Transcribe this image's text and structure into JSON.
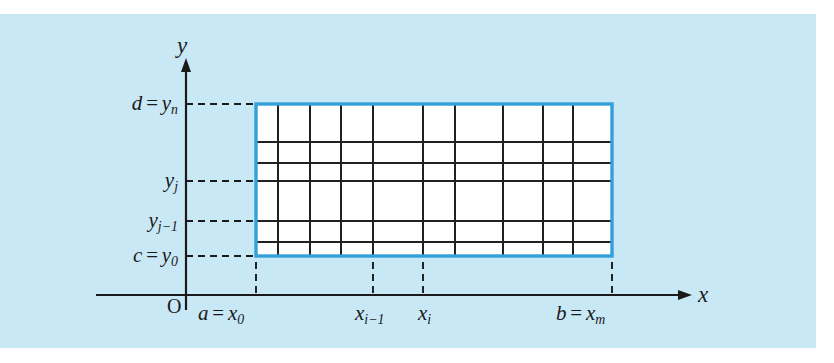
{
  "figure": {
    "kind": "partitioned-rectangle-double-integral-diagram",
    "background_color": "#c9e8f5",
    "page_color": "#ffffff",
    "region_fill_color": "#ffffff",
    "region_border_color": "#33a0dd",
    "grid_color": "#231f20",
    "axis_color": "#1a1a1a"
  },
  "axes": {
    "y_axis_label": "y",
    "x_axis_label": "x",
    "origin_label": "O"
  },
  "y_labels": [
    {
      "id": "y-top",
      "text_prefix": "d",
      "equals": "=",
      "base": "y",
      "subscript": "n",
      "value_y": 104
    },
    {
      "id": "y-j",
      "text_prefix": "",
      "equals": "",
      "base": "y",
      "subscript": "j",
      "value_y": 181
    },
    {
      "id": "y-j-minus-1",
      "text_prefix": "",
      "equals": "",
      "base": "y",
      "subscript": "j−1",
      "value_y": 221
    },
    {
      "id": "y-bottom",
      "text_prefix": "c",
      "equals": "=",
      "base": "y",
      "subscript": "0",
      "value_y": 256
    }
  ],
  "x_labels": [
    {
      "id": "x-left",
      "text_prefix": "a",
      "equals": "=",
      "base": "x",
      "subscript": "0",
      "value_x": 256
    },
    {
      "id": "x-i-minus-1",
      "text_prefix": "",
      "equals": "",
      "base": "x",
      "subscript": "i−1",
      "value_x": 373
    },
    {
      "id": "x-i",
      "text_prefix": "",
      "equals": "",
      "base": "x",
      "subscript": "i",
      "value_x": 423
    },
    {
      "id": "x-right",
      "text_prefix": "b",
      "equals": "=",
      "base": "x",
      "subscript": "m",
      "value_x": 612
    }
  ],
  "rectangle": {
    "left": 256,
    "right": 612,
    "top": 104,
    "bottom": 256
  },
  "grid": {
    "vertical_lines": [
      278,
      310,
      341,
      373,
      423,
      455,
      503,
      543,
      573
    ],
    "horizontal_lines": [
      142,
      163,
      181,
      221,
      242
    ]
  },
  "leaders": {
    "horizontal_dashed_from_x": 186,
    "vertical_dashed_to_y": 295
  }
}
